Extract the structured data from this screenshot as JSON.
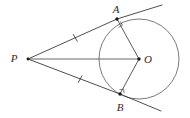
{
  "figure": {
    "type": "euclidean-geometry-diagram",
    "background_color": "#ffffff",
    "line_color": "#3a3a3a",
    "circle_color": "#6b6b6b",
    "label_color": "#2b2b2b"
  },
  "points": {
    "P": {
      "label": "P",
      "x": 28,
      "y": 59,
      "label_x": 14,
      "label_y": 62,
      "role": "external-point"
    },
    "A": {
      "label": "A",
      "x": 117,
      "y": 19,
      "label_x": 114,
      "label_y": 13,
      "role": "tangency-point-upper"
    },
    "B": {
      "label": "B",
      "x": 120,
      "y": 94,
      "label_x": 117,
      "label_y": 110,
      "role": "tangency-point-lower"
    },
    "O": {
      "label": "O",
      "x": 139,
      "y": 59,
      "label_x": 145,
      "label_y": 63,
      "role": "circle-center"
    }
  },
  "circle": {
    "center_x": 139,
    "center_y": 59,
    "radius": 40
  },
  "segments": [
    {
      "name": "PA",
      "from": "P",
      "to": "A",
      "kind": "tangent",
      "ticks": 1
    },
    {
      "name": "PB",
      "from": "P",
      "to": "B",
      "kind": "tangent",
      "ticks": 1
    },
    {
      "name": "PO",
      "from": "P",
      "to": "O",
      "kind": "axis",
      "ticks": 0
    },
    {
      "name": "OA",
      "from": "O",
      "to": "A",
      "kind": "radius",
      "ticks": 0
    },
    {
      "name": "OB",
      "from": "O",
      "to": "B",
      "kind": "radius",
      "ticks": 0
    }
  ],
  "tangent_extensions": [
    {
      "name": "A-extension",
      "x1": 117,
      "y1": 19,
      "x2": 162,
      "y2": 5
    },
    {
      "name": "B-extension",
      "x1": 120,
      "y1": 94,
      "x2": 161,
      "y2": 111
    }
  ],
  "tick_marks": [
    {
      "name": "tick-PA",
      "x": 75,
      "y": 38,
      "angle": -20
    },
    {
      "name": "tick-PB",
      "x": 80,
      "y": 79,
      "angle": 20
    }
  ],
  "right_angles": [
    {
      "name": "right-angle-at-A",
      "x": 117,
      "y": 19
    },
    {
      "name": "right-angle-at-B",
      "x": 120,
      "y": 94
    }
  ]
}
